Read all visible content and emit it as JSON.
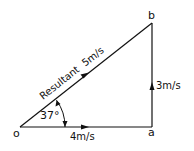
{
  "diagram": {
    "type": "vector-triangle",
    "points": {
      "o": {
        "label": "o",
        "x": 20,
        "y": 127
      },
      "a": {
        "label": "a",
        "x": 152,
        "y": 127
      },
      "b": {
        "label": "b",
        "x": 152,
        "y": 23
      }
    },
    "vectors": [
      {
        "from": "o",
        "to": "a",
        "label": "4m/s"
      },
      {
        "from": "a",
        "to": "b",
        "label": "3m/s"
      },
      {
        "from": "o",
        "to": "b",
        "label": "Resultant  5m/s"
      }
    ],
    "angle": {
      "at": "o",
      "label": "37°"
    },
    "colors": {
      "line": "#111111",
      "background": "#ffffff"
    }
  }
}
